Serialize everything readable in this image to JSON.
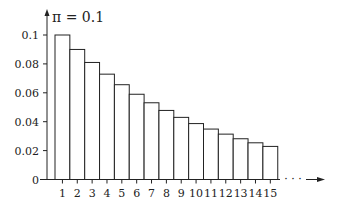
{
  "chart_data": {
    "type": "bar",
    "title": "π = 0.1",
    "xlabel": "",
    "ylabel": "",
    "categories": [
      "1",
      "2",
      "3",
      "4",
      "5",
      "6",
      "7",
      "8",
      "9",
      "10",
      "11",
      "12",
      "13",
      "14",
      "15"
    ],
    "values": [
      0.1,
      0.09,
      0.081,
      0.0729,
      0.0656,
      0.059,
      0.0531,
      0.0478,
      0.043,
      0.0387,
      0.0349,
      0.0314,
      0.0282,
      0.0254,
      0.0229
    ],
    "yticks": [
      "0",
      "0.02",
      "0.04",
      "0.06",
      "0.08",
      "0.1"
    ],
    "ytick_values": [
      0,
      0.02,
      0.04,
      0.06,
      0.08,
      0.1
    ],
    "ylim": [
      0,
      0.1
    ],
    "x_continuation": "· · ·",
    "grid": false,
    "legend": null
  }
}
